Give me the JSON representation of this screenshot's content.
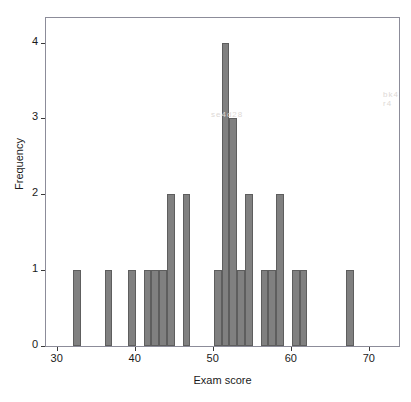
{
  "chart_data": {
    "type": "bar",
    "title": "",
    "subtitle": "",
    "xlabel": "Exam score",
    "ylabel": "Frequency",
    "xlim": [
      28.5,
      74.0
    ],
    "ylim": [
      0,
      4.35
    ],
    "xticks": [
      30,
      40,
      50,
      60,
      70
    ],
    "yticks": [
      0,
      1,
      2,
      3,
      4
    ],
    "xtick_labels": [
      "30",
      "40",
      "50",
      "60",
      "70"
    ],
    "ytick_labels": [
      "0",
      "1",
      "2",
      "3",
      "4"
    ],
    "grid": false,
    "legend": false,
    "legend_position": "none",
    "bin_width": 1,
    "bar_color": "#808080",
    "bar_edge_color": "#5e5e5e",
    "frame_color": "#8c8c99",
    "background_color": "#ffffff",
    "categories": [
      32,
      36,
      39,
      41,
      42,
      43,
      44,
      46,
      50,
      51,
      52,
      53,
      54,
      56,
      57,
      58,
      60,
      61,
      67
    ],
    "values": [
      1,
      1,
      1,
      1,
      1,
      1,
      2,
      2,
      1,
      4,
      3,
      1,
      2,
      1,
      1,
      2,
      1,
      1,
      1
    ],
    "bars": [
      {
        "x": 32,
        "value": 1
      },
      {
        "x": 36,
        "value": 1
      },
      {
        "x": 39,
        "value": 1
      },
      {
        "x": 41,
        "value": 1
      },
      {
        "x": 42,
        "value": 1
      },
      {
        "x": 43,
        "value": 1
      },
      {
        "x": 44,
        "value": 2
      },
      {
        "x": 46,
        "value": 2
      },
      {
        "x": 50,
        "value": 1
      },
      {
        "x": 51,
        "value": 4
      },
      {
        "x": 52,
        "value": 3
      },
      {
        "x": 53,
        "value": 1
      },
      {
        "x": 54,
        "value": 2
      },
      {
        "x": 56,
        "value": 1
      },
      {
        "x": 57,
        "value": 1
      },
      {
        "x": 58,
        "value": 2
      },
      {
        "x": 60,
        "value": 1
      },
      {
        "x": 61,
        "value": 1
      },
      {
        "x": 67,
        "value": 1
      }
    ],
    "total_count": 25
  },
  "artifacts": [
    {
      "text": "se4d28",
      "left": 165,
      "top": 92
    },
    {
      "text": "bk4 r4",
      "left": 337,
      "top": 72
    }
  ]
}
